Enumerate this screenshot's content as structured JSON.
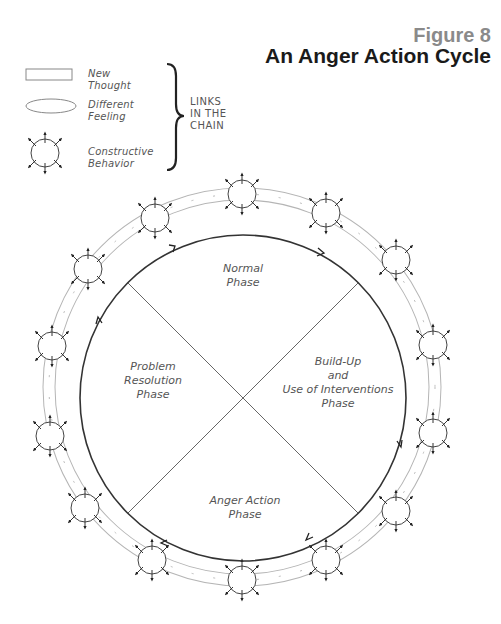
{
  "figure": {
    "number": "Figure 8",
    "title": "An Anger Action Cycle"
  },
  "legend": {
    "items": [
      {
        "shape": "rectangle",
        "label_line1": "New",
        "label_line2": "Thought"
      },
      {
        "shape": "ellipse",
        "label_line1": "Different",
        "label_line2": "Feeling"
      },
      {
        "shape": "circle-with-arrows",
        "label_line1": "Constructive",
        "label_line2": "Behavior"
      }
    ],
    "brace_label_line1": "LINKS",
    "brace_label_line2": "IN THE",
    "brace_label_line3": "CHAIN"
  },
  "cycle": {
    "direction": "clockwise",
    "phases": [
      {
        "position": "top",
        "line1": "Normal",
        "line2": "Phase"
      },
      {
        "position": "right",
        "line1": "Build-Up",
        "line2": "and",
        "line3": "Use of Interventions",
        "line4": "Phase"
      },
      {
        "position": "bottom",
        "line1": "Anger Action",
        "line2": "Phase"
      },
      {
        "position": "left",
        "line1": "Problem",
        "line2": "Resolution",
        "line3": "Phase"
      }
    ],
    "outer_chain_node_count": 14
  },
  "colors": {
    "title": "#1a1a1a",
    "figure_number": "#8a8a8a",
    "line": "#333333",
    "chain_link": "#aaaaaa",
    "text": "#555555"
  }
}
